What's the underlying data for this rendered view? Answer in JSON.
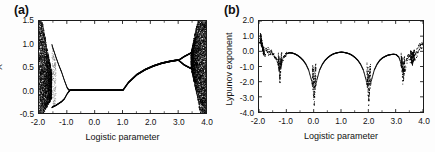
{
  "figure": {
    "background": "#ffffff",
    "ink_color": "#111111"
  },
  "panels": [
    {
      "id": "a",
      "label": "(a)",
      "xlabel": "Logistic parameter",
      "ylabel": "X",
      "xticks": [
        "-2.0",
        "-1.0",
        "0.0",
        "1.0",
        "2.0",
        "3.0",
        "4.0"
      ],
      "yticks": [
        "1.5",
        "1.0",
        "0.5",
        "0.0",
        "-0.5"
      ]
    },
    {
      "id": "b",
      "label": "(b)",
      "xlabel": "Logistic parameter",
      "ylabel": "Lypunov exponent",
      "xticks": [
        "-2.0",
        "-1.0",
        "0.0",
        "1.0",
        "2.0",
        "3.0",
        "4.0"
      ],
      "yticks": [
        "2.0",
        "1.0",
        "0.0",
        "-1.0",
        "-2.0",
        "-3.0",
        "-4.0"
      ]
    }
  ],
  "chart_data": [
    {
      "type": "scatter",
      "panel": "a",
      "title": "(a)",
      "xlabel": "Logistic parameter",
      "ylabel": "X",
      "xlim": [
        -2.0,
        4.0
      ],
      "ylim": [
        -0.5,
        1.5
      ],
      "xticks": [
        -2.0,
        -1.0,
        0.0,
        1.0,
        2.0,
        3.0,
        4.0
      ],
      "yticks": [
        -0.5,
        0.0,
        0.5,
        1.0,
        1.5
      ],
      "grid": false,
      "legend": false,
      "description": "Bifurcation diagram of a logistic-type map. Dense chaotic band at the far left (r near -2.0) spanning the full vertical range, collapsing through a period-doubling cascade into a single fixed branch at x=0 for roughly -0.9 < r < 1.0; the branch rises from x=0 at r=1.0 toward x~0.65 near r=3.0, then period-doubles and becomes chaotic again filling the band up to r=4.0.",
      "regions": [
        {
          "name": "left-chaotic-band",
          "x_range": [
            -2.0,
            -1.55
          ],
          "y_range": [
            -0.5,
            1.5
          ]
        },
        {
          "name": "left-period-2-bubble",
          "x_range": [
            -1.55,
            -0.9
          ],
          "y_upper": [
            1.5,
            0.0
          ],
          "y_lower": [
            -0.5,
            0.0
          ]
        },
        {
          "name": "fixed-point-zero",
          "x_range": [
            -0.9,
            1.0
          ],
          "y_value": 0.0
        },
        {
          "name": "rising-branch",
          "x_range": [
            1.0,
            3.0
          ],
          "y_range": [
            0.0,
            0.66
          ]
        },
        {
          "name": "period-2-window",
          "x_range": [
            3.0,
            3.45
          ],
          "y_range": [
            0.45,
            0.8
          ]
        },
        {
          "name": "right-chaotic-band",
          "x_range": [
            3.45,
            4.0
          ],
          "y_range": [
            -0.5,
            1.5
          ]
        }
      ],
      "upper_envelope_x": [
        -2.0,
        -1.9,
        -1.8,
        -1.7,
        -1.6,
        -1.55,
        -1.5,
        -1.4,
        -1.3,
        -1.2,
        -1.1,
        -1.0,
        -0.95,
        -0.9,
        0.0,
        1.0,
        1.2,
        1.5,
        1.8,
        2.1,
        2.4,
        2.7,
        3.0,
        3.2,
        3.45,
        3.6,
        3.8,
        4.0
      ],
      "upper_envelope_y": [
        1.5,
        1.42,
        1.32,
        1.2,
        1.06,
        1.0,
        0.9,
        0.72,
        0.55,
        0.4,
        0.22,
        0.06,
        0.02,
        0.0,
        0.0,
        0.0,
        0.17,
        0.34,
        0.45,
        0.53,
        0.59,
        0.63,
        0.66,
        0.74,
        0.82,
        1.02,
        1.3,
        1.5
      ],
      "lower_envelope_x": [
        -2.0,
        -1.9,
        -1.8,
        -1.7,
        -1.6,
        -1.55,
        -1.5,
        -1.4,
        -1.3,
        -1.2,
        -1.1,
        -1.0,
        -0.95,
        -0.9,
        0.0,
        1.0,
        1.2,
        1.5,
        1.8,
        2.1,
        2.4,
        2.7,
        3.0,
        3.2,
        3.45,
        3.6,
        3.8,
        4.0
      ],
      "lower_envelope_y": [
        -0.5,
        -0.47,
        -0.44,
        -0.41,
        -0.38,
        -0.37,
        -0.35,
        -0.32,
        -0.28,
        -0.24,
        -0.18,
        -0.07,
        -0.03,
        0.0,
        0.0,
        0.0,
        0.17,
        0.34,
        0.45,
        0.53,
        0.59,
        0.63,
        0.66,
        0.56,
        0.48,
        0.3,
        0.0,
        -0.5
      ]
    },
    {
      "type": "line",
      "panel": "b",
      "title": "(b)",
      "xlabel": "Logistic parameter",
      "ylabel": "Lypunov exponent",
      "xlim": [
        -2.0,
        4.0
      ],
      "ylim": [
        -4.0,
        2.0
      ],
      "xticks": [
        -2.0,
        -1.0,
        0.0,
        1.0,
        2.0,
        3.0,
        4.0
      ],
      "yticks": [
        -4.0,
        -3.0,
        -2.0,
        -1.0,
        0.0,
        1.0,
        2.0
      ],
      "grid": false,
      "legend": false,
      "description": "Lyapunov exponent versus logistic parameter. Positive (~0.6) at r=-2.0, dropping steeply at r about -1.9, with sharp negative spikes (superstable orbits) at r about -1.25 (to -2.3), r=0.0 (to -3.8), r=2.0 (to -3.8) and r about 3.25 (to -2.3). Between spikes the exponent rises to a broad plateau just below 0, peaking near 0 at r=1.0, and becomes positive again as r approaches 4.0.",
      "spikes": [
        {
          "x": -1.9,
          "depth": -1.2
        },
        {
          "x": -1.25,
          "depth": -2.35
        },
        {
          "x": 0.0,
          "depth": -3.85
        },
        {
          "x": 2.0,
          "depth": -3.85
        },
        {
          "x": 3.25,
          "depth": -2.35
        },
        {
          "x": 3.6,
          "depth": -1.1
        }
      ],
      "x": [
        -2.0,
        -1.95,
        -1.9,
        -1.85,
        -1.8,
        -1.7,
        -1.6,
        -1.5,
        -1.45,
        -1.4,
        -1.35,
        -1.3,
        -1.27,
        -1.25,
        -1.23,
        -1.2,
        -1.15,
        -1.1,
        -1.0,
        -0.9,
        -0.8,
        -0.7,
        -0.6,
        -0.5,
        -0.4,
        -0.3,
        -0.2,
        -0.1,
        -0.05,
        -0.02,
        0.0,
        0.02,
        0.05,
        0.1,
        0.2,
        0.3,
        0.4,
        0.5,
        0.6,
        0.7,
        0.8,
        0.9,
        1.0,
        1.1,
        1.2,
        1.3,
        1.4,
        1.5,
        1.6,
        1.7,
        1.8,
        1.9,
        1.95,
        1.98,
        2.0,
        2.02,
        2.05,
        2.1,
        2.2,
        2.3,
        2.4,
        2.5,
        2.6,
        2.7,
        2.8,
        2.9,
        3.0,
        3.1,
        3.15,
        3.2,
        3.25,
        3.3,
        3.35,
        3.4,
        3.5,
        3.6,
        3.7,
        3.8,
        3.9,
        4.0
      ],
      "y": [
        0.62,
        0.5,
        0.2,
        -0.25,
        -0.05,
        0.02,
        -0.02,
        -0.12,
        -0.3,
        -0.42,
        -0.62,
        -1.0,
        -1.6,
        -2.35,
        -1.6,
        -1.0,
        -0.55,
        -0.32,
        -0.12,
        -0.06,
        -0.08,
        -0.14,
        -0.24,
        -0.38,
        -0.56,
        -0.82,
        -1.2,
        -1.85,
        -2.4,
        -3.1,
        -3.85,
        -3.1,
        -2.4,
        -1.85,
        -1.2,
        -0.82,
        -0.56,
        -0.38,
        -0.24,
        -0.14,
        -0.08,
        -0.04,
        -0.02,
        -0.04,
        -0.08,
        -0.14,
        -0.24,
        -0.38,
        -0.56,
        -0.82,
        -1.2,
        -1.85,
        -2.4,
        -3.1,
        -3.85,
        -3.1,
        -2.4,
        -1.85,
        -1.2,
        -0.82,
        -0.56,
        -0.4,
        -0.3,
        -0.22,
        -0.18,
        -0.16,
        -0.18,
        -0.35,
        -0.6,
        -1.1,
        -2.3,
        -1.5,
        -0.9,
        -0.55,
        -0.35,
        -0.9,
        -0.3,
        0.1,
        0.35,
        0.65
      ]
    }
  ]
}
